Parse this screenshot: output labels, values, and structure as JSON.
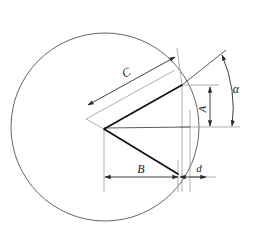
{
  "figure": {
    "background_color": "#ffffff",
    "width": 253,
    "height": 234
  },
  "style": {
    "circle_stroke": "#555555",
    "thick_stroke": "#111111",
    "thin_stroke": "#4a4a4a",
    "extension_stroke": "#8c8c8c",
    "label_color": "#1a1a1a"
  },
  "geometry": {
    "circle": {
      "center_x": 105,
      "center_y": 127,
      "radius": 94
    },
    "vertex": {
      "x": 104,
      "y": 129
    },
    "upper_point": {
      "x": 182,
      "y": 85
    },
    "lower_point": {
      "x": 178,
      "y": 174
    },
    "horizontal_axis_y": 127,
    "right_edge_x": 190
  },
  "labels": {
    "c": "C",
    "a": "A",
    "b": "B",
    "d": "d",
    "alpha": "α"
  },
  "dimensions": [
    {
      "id": "dim-c",
      "label": "C",
      "orientation": "oblique",
      "from_x": 88,
      "from_y": 105,
      "to_x": 175,
      "to_y": 57,
      "label_x": 128,
      "label_y": 75
    },
    {
      "id": "dim-a",
      "label": "A",
      "orientation": "vertical",
      "from_x": 210,
      "from_y": 86,
      "to_x": 210,
      "to_y": 127,
      "label_x": 206,
      "label_y": 108
    },
    {
      "id": "dim-b",
      "label": "B",
      "orientation": "horizontal",
      "from_x": 104,
      "from_y": 177,
      "to_x": 179,
      "to_y": 177,
      "label_x": 141,
      "label_y": 172
    },
    {
      "id": "dim-d",
      "label": "d",
      "orientation": "horizontal",
      "from_x": 179,
      "from_y": 177,
      "to_x": 207,
      "to_y": 177,
      "label_x": 199,
      "label_y": 171
    },
    {
      "id": "dim-alpha",
      "label": "α",
      "orientation": "angular",
      "arc_from_x": 222,
      "arc_from_y": 55,
      "arc_to_x": 232,
      "arc_to_y": 127,
      "label_x": 234,
      "label_y": 90
    }
  ]
}
